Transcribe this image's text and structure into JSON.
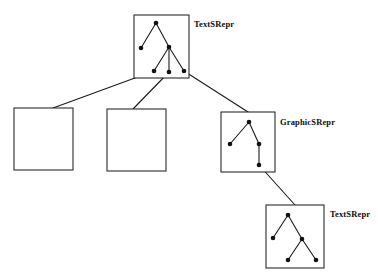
{
  "figure": {
    "background_color": "#ffffff",
    "stroke_color": "#1a1a1a",
    "box_stroke_color": "#2b2b2b",
    "node_color": "#111111",
    "top_cropped_text": "",
    "boxes": [
      {
        "id": "root-box",
        "label": "TextSRepr",
        "label_x": 194,
        "label_y": 19,
        "x": 134,
        "y": 15,
        "w": 55,
        "h": 63,
        "tree": {
          "nodes": [
            {
              "id": "n0",
              "x": 22,
              "y": 8
            },
            {
              "id": "n1",
              "x": 7,
              "y": 33
            },
            {
              "id": "n2",
              "x": 35,
              "y": 32
            },
            {
              "id": "n3",
              "x": 20,
              "y": 56
            },
            {
              "id": "n4",
              "x": 35,
              "y": 57
            },
            {
              "id": "n5",
              "x": 50,
              "y": 56
            }
          ],
          "edges": [
            [
              "n0",
              "n1"
            ],
            [
              "n0",
              "n2"
            ],
            [
              "n2",
              "n3"
            ],
            [
              "n2",
              "n4"
            ],
            [
              "n2",
              "n5"
            ]
          ]
        }
      },
      {
        "id": "empty-box-left",
        "label": "",
        "x": 14,
        "y": 108,
        "w": 59,
        "h": 62,
        "tree": {
          "nodes": [],
          "edges": []
        }
      },
      {
        "id": "empty-box-middle",
        "label": "",
        "x": 107,
        "y": 109,
        "w": 59,
        "h": 62,
        "tree": {
          "nodes": [],
          "edges": []
        }
      },
      {
        "id": "graphic-box",
        "label": "GraphicSRepr",
        "label_x": 280,
        "label_y": 117,
        "x": 221,
        "y": 112,
        "w": 54,
        "h": 60,
        "tree": {
          "nodes": [
            {
              "id": "g0",
              "x": 28,
              "y": 10
            },
            {
              "id": "g1",
              "x": 9,
              "y": 32
            },
            {
              "id": "g2",
              "x": 38,
              "y": 32
            },
            {
              "id": "g3",
              "x": 38,
              "y": 53
            }
          ],
          "edges": [
            [
              "g0",
              "g1"
            ],
            [
              "g0",
              "g2"
            ],
            [
              "g2",
              "g3"
            ]
          ]
        }
      },
      {
        "id": "leaf-text-box",
        "label": "TextSRepr",
        "label_x": 330,
        "label_y": 209,
        "x": 266,
        "y": 205,
        "w": 58,
        "h": 63,
        "tree": {
          "nodes": [
            {
              "id": "t0",
              "x": 22,
              "y": 10
            },
            {
              "id": "t1",
              "x": 7,
              "y": 33
            },
            {
              "id": "t2",
              "x": 36,
              "y": 34
            },
            {
              "id": "t3",
              "x": 22,
              "y": 55
            },
            {
              "id": "t4",
              "x": 50,
              "y": 55
            }
          ],
          "edges": [
            [
              "t0",
              "t1"
            ],
            [
              "t0",
              "t2"
            ],
            [
              "t2",
              "t3"
            ],
            [
              "t2",
              "t4"
            ]
          ]
        }
      }
    ],
    "connectors": [
      {
        "id": "root-to-left-box",
        "x1": 154,
        "y1": 71,
        "x2": 53,
        "y2": 108
      },
      {
        "id": "root-to-middle-box",
        "x1": 169,
        "y1": 72,
        "x2": 133,
        "y2": 109
      },
      {
        "id": "root-to-graphic-box",
        "x1": 184,
        "y1": 71,
        "x2": 248,
        "y2": 112
      },
      {
        "id": "graphic-to-leaf-box",
        "x1": 259,
        "y1": 165,
        "x2": 295,
        "y2": 205
      }
    ]
  }
}
